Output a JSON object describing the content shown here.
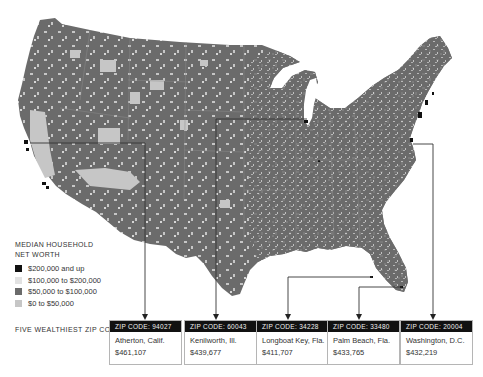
{
  "map": {
    "title": "Median household net worth by ZIP code, contiguous United States",
    "colors": {
      "land_base": "#6b6b6b",
      "tier_200k_up": "#111111",
      "tier_100k_200k": "#e2e2e2",
      "tier_50k_100k": "#6b6b6b",
      "tier_0_50k": "#c6c6c6",
      "state_border": "#8a8a8a",
      "leader_line": "#444444"
    }
  },
  "legend": {
    "title_line1": "MEDIAN HOUSEHOLD",
    "title_line2": "NET WORTH",
    "items": [
      {
        "label": "$200,000 and up",
        "color": "#111111"
      },
      {
        "label": "$100,000 to $200,000",
        "color": "#e2e2e2"
      },
      {
        "label": "$50,000 to $100,000",
        "color": "#6b6b6b"
      },
      {
        "label": "$0 to $50,000",
        "color": "#c6c6c6"
      }
    ]
  },
  "wealthiest": {
    "label": "FIVE WEALTHIEST ZIP CODES",
    "zips": [
      {
        "header": "ZIP CODE: 94027",
        "place": "Atherton, Calif.",
        "value": "$461,107"
      },
      {
        "header": "ZIP CODE: 60043",
        "place": "Kenilworth, Ill.",
        "value": "$439,677"
      },
      {
        "header": "ZIP CODE: 34228",
        "place": "Longboat Key, Fla.",
        "value": "$411,707"
      },
      {
        "header": "ZIP CODE: 33480",
        "place": "Palm Beach, Fla.",
        "value": "$433,765"
      },
      {
        "header": "ZIP CODE: 20004",
        "place": "Washington, D.C.",
        "value": "$432,219"
      }
    ]
  }
}
